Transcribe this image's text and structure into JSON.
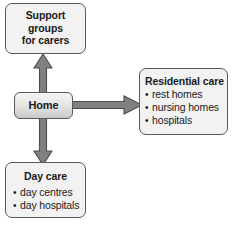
{
  "diagram": {
    "background_color": "#ffffff",
    "node_fill": "#f2f2f2",
    "node_border": "#595959",
    "arrow_fill": "#808080",
    "arrow_border": "#4d4d4d",
    "text_color": "#1a1a1a"
  },
  "nodes": {
    "support": {
      "name": "support-groups",
      "line1": "Support",
      "line2": "groups",
      "line3": "for carers"
    },
    "home": {
      "name": "home",
      "label": "Home"
    },
    "residential": {
      "name": "residential-care",
      "title": "Residential care",
      "items": [
        "rest homes",
        "nursing homes",
        "hospitals"
      ]
    },
    "daycare": {
      "name": "day-care",
      "title": "Day care",
      "items": [
        "day centres",
        "day hospitals"
      ]
    }
  },
  "arrows": [
    {
      "id": "home-to-support",
      "direction": "up",
      "from": "home",
      "to": "support"
    },
    {
      "id": "home-to-daycare",
      "direction": "down",
      "from": "home",
      "to": "daycare"
    },
    {
      "id": "home-to-residential",
      "direction": "right",
      "from": "home",
      "to": "residential"
    }
  ]
}
